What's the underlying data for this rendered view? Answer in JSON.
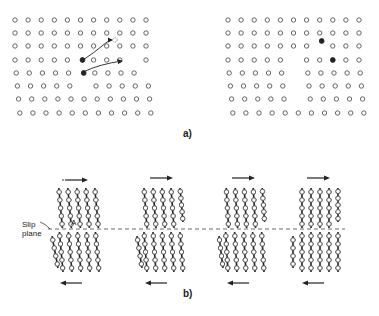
{
  "figure": {
    "part_a": {
      "label": "a)",
      "left_grid": {
        "rows": 8,
        "cols": 11,
        "vacancies": [
          [
            3,
            9
          ],
          [
            4,
            10
          ]
        ],
        "interstitials": [
          [
            3,
            5
          ],
          [
            4,
            5
          ]
        ],
        "arrow_count": 2
      },
      "right_grid": {
        "rows": 8,
        "cols": 11,
        "vacancy_col_rows": [
          3,
          4,
          5,
          6
        ],
        "filled_atoms": [
          [
            2,
            7
          ],
          [
            3,
            8
          ]
        ]
      }
    },
    "part_b": {
      "label": "b)",
      "slip_plane_label_line1": "Slip",
      "slip_plane_label_line2": "plane",
      "marker_label": "A",
      "stages": 4,
      "top_arrow_direction": "right",
      "bottom_arrow_direction": "left"
    },
    "colors": {
      "ink": "#222222",
      "background": "#ffffff",
      "open_atom": "#555555"
    }
  }
}
